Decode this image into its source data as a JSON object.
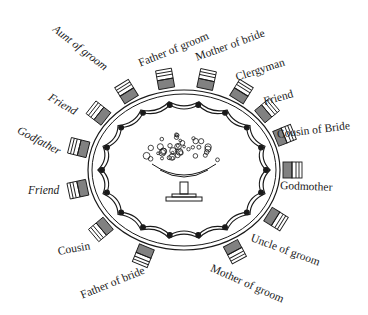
{
  "diagram": {
    "centerpiece": "flower-urn",
    "table_shape": "oval",
    "colors": {
      "ink": "#1a1a1a",
      "background": "#ffffff"
    },
    "seats": [
      {
        "label": "Aunt of groom",
        "x": 54,
        "y": 22,
        "rot": 38
      },
      {
        "label": "Father of groom",
        "x": 139,
        "y": 58,
        "rot": -22
      },
      {
        "label": "Mother of bride",
        "x": 196,
        "y": 52,
        "rot": -20
      },
      {
        "label": "Clergyman",
        "x": 236,
        "y": 72,
        "rot": -18
      },
      {
        "label": "Friend",
        "x": 264,
        "y": 96,
        "rot": -15
      },
      {
        "label": "Cousin of Bride",
        "x": 277,
        "y": 129,
        "rot": -7
      },
      {
        "label": "Godmother",
        "x": 280,
        "y": 180,
        "rot": 2
      },
      {
        "label": "Uncle of groom",
        "x": 251,
        "y": 232,
        "rot": 20
      },
      {
        "label": "Mother of groom",
        "x": 211,
        "y": 262,
        "rot": 24
      },
      {
        "label": "Father of bride",
        "x": 81,
        "y": 290,
        "rot": -22
      },
      {
        "label": "Cousin",
        "x": 58,
        "y": 246,
        "rot": -10
      },
      {
        "label": "Friend",
        "x": 28,
        "y": 185,
        "rot": 0
      },
      {
        "label": "Godfather",
        "x": 18,
        "y": 124,
        "rot": 28
      },
      {
        "label": "Friend",
        "x": 49,
        "y": 91,
        "rot": 30
      }
    ]
  }
}
